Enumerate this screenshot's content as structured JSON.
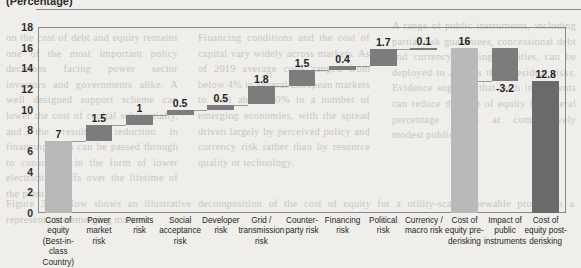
{
  "header": {
    "caption": "(Percentage)"
  },
  "chart_data": {
    "type": "bar",
    "subtype": "waterfall",
    "title": "(Percentage)",
    "xlabel": "",
    "ylabel": "",
    "ylim": [
      0,
      18
    ],
    "yticks": [
      18,
      16,
      14,
      12,
      10,
      8,
      6,
      4,
      2,
      0
    ],
    "grid": false,
    "legend": "none",
    "categories": [
      "Cost of equity (Best-in-class Country)",
      "Power market risk",
      "Permits risk",
      "Social acceptance risk",
      "Developer risk",
      "Grid / transmission risk",
      "Counter-party risk",
      "Financing risk",
      "Political risk",
      "Currency / macro risk",
      "Cost of equity pre-derisking",
      "Impact of public instruments",
      "Cost of equity post-derisking"
    ],
    "category_lines": [
      [
        "Cost of equity",
        "(Best-in-class",
        "Country)"
      ],
      [
        "Power",
        "market",
        "risk"
      ],
      [
        "Permits",
        "risk"
      ],
      [
        "Social",
        "acceptance",
        "risk"
      ],
      [
        "Developer",
        "risk"
      ],
      [
        "Grid /",
        "transmission",
        "risk"
      ],
      [
        "Counter-",
        "party risk"
      ],
      [
        "Financing",
        "risk"
      ],
      [
        "Political",
        "risk"
      ],
      [
        "Currency /",
        "macro risk"
      ],
      [
        "Cost of",
        "equity pre-",
        "derisking"
      ],
      [
        "Impact of",
        "public",
        "instruments"
      ],
      [
        "Cost of",
        "equity post-",
        "derisking"
      ]
    ],
    "values": [
      7,
      1.5,
      1,
      0.5,
      0.5,
      1.8,
      1.5,
      0.4,
      1.7,
      0.1,
      16,
      -3.2,
      12.8
    ],
    "value_labels": [
      "7",
      "1.5",
      "1",
      "0.5",
      "0.5",
      "1.8",
      "1.5",
      "0.4",
      "1.7",
      "0.1",
      "16",
      "-3.2",
      "12.8"
    ],
    "bar_kind": [
      "total",
      "delta",
      "delta",
      "delta",
      "delta",
      "delta",
      "delta",
      "delta",
      "delta",
      "delta",
      "total",
      "delta",
      "total"
    ],
    "bar_base": [
      0,
      7,
      8.5,
      9.5,
      10,
      10.5,
      12.3,
      13.8,
      14.2,
      15.9,
      0,
      12.8,
      0
    ],
    "bar_top": [
      7,
      8.5,
      9.5,
      10,
      10.5,
      12.3,
      13.8,
      14.2,
      15.9,
      16,
      16,
      16,
      12.8
    ],
    "colors": {
      "delta": "#7c7c7c",
      "total_light": "#b9b9b9",
      "total_dark": "#6a6a6a",
      "connector": "#9a9a9a",
      "frame": "#8a8a8a",
      "text": "#1f1f1f",
      "background": "#efeeea"
    }
  },
  "ghost_text": {
    "col1": "on the cost of debt and equity remains one of the most important policy decisions facing power sector investors and governments alike. A well designed support scheme can lower the cost of capital substantially, and the resulting reduction in financing costs can be passed through to consumers in the form of lower electricity tariffs over the lifetime of the plant.",
    "col2": "Financing conditions and the cost of capital vary widely across markets. As of 2019 average costs ranged from below 4% in several European markets to well above 10% in a number of emerging economies, with the spread driven largely by perceived policy and currency risk rather than by resource quality or technology.",
    "col3": "A range of public instruments, including partial risk guarantees, concessional debt and currency hedging facilities, can be deployed to address these residual risks. Evidence suggests that such instruments can reduce the cost of equity by several percentage points at comparatively modest public cost.",
    "lowline": "Figure 3.2 below shows an illustrative decomposition of the cost of equity for a utility-scale renewable project in a representative emerging market."
  }
}
